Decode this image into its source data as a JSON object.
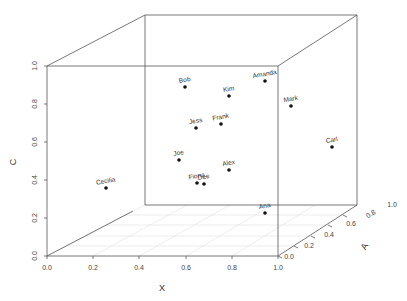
{
  "chart_data": {
    "type": "scatter3d",
    "title": "",
    "xlabel": "X",
    "ylabel": "A",
    "zlabel": "C",
    "xlim": [
      0,
      1
    ],
    "ylim": [
      0,
      1
    ],
    "zlim": [
      0,
      1
    ],
    "x_ticks": [
      "0.0",
      "0.2",
      "0.4",
      "0.6",
      "0.8",
      "1.0"
    ],
    "y_ticks": [
      "0.0",
      "0.2",
      "0.4",
      "0.6",
      "0.8",
      "1.0"
    ],
    "z_ticks": [
      "0.0",
      "0.2",
      "0.4",
      "0.6",
      "0.8",
      "1.0"
    ],
    "grid": "floor",
    "box": true,
    "points": [
      {
        "label": "Bob",
        "x": 0.45,
        "y": 0.75,
        "z": 0.9
      },
      {
        "label": "Kim",
        "x": 0.65,
        "y": 0.75,
        "z": 0.85
      },
      {
        "label": "Amanda",
        "x": 0.85,
        "y": 0.65,
        "z": 0.95
      },
      {
        "label": "Jess",
        "x": 0.5,
        "y": 0.7,
        "z": 0.7
      },
      {
        "label": "Frank",
        "x": 0.62,
        "y": 0.7,
        "z": 0.72
      },
      {
        "label": "Mark",
        "x": 0.95,
        "y": 0.5,
        "z": 0.8
      },
      {
        "label": "Joe",
        "x": 0.45,
        "y": 0.65,
        "z": 0.55
      },
      {
        "label": "Alex",
        "x": 0.7,
        "y": 0.6,
        "z": 0.48
      },
      {
        "label": "Fiona",
        "x": 0.52,
        "y": 0.7,
        "z": 0.42
      },
      {
        "label": "Dee",
        "x": 0.56,
        "y": 0.7,
        "z": 0.41
      },
      {
        "label": "Carl",
        "x": 0.98,
        "y": 0.9,
        "z": 0.58
      },
      {
        "label": "Cecilia",
        "x": 0.25,
        "y": 0.05,
        "z": 0.36
      },
      {
        "label": "Ana",
        "x": 0.85,
        "y": 0.55,
        "z": 0.05
      }
    ]
  },
  "points_px": [
    {
      "label": "Bob",
      "cx": 185,
      "cy": 87
    },
    {
      "label": "Kim",
      "cx": 229,
      "cy": 96
    },
    {
      "label": "Amanda",
      "cx": 265,
      "cy": 81
    },
    {
      "label": "Jess",
      "cx": 196,
      "cy": 128
    },
    {
      "label": "Frank",
      "cx": 221,
      "cy": 124
    },
    {
      "label": "Mark",
      "cx": 291,
      "cy": 106
    },
    {
      "label": "Joe",
      "cx": 179,
      "cy": 160
    },
    {
      "label": "Alex",
      "cx": 229,
      "cy": 170
    },
    {
      "label": "Fiona",
      "cx": 197,
      "cy": 183
    },
    {
      "label": "Dee",
      "cx": 204,
      "cy": 184
    },
    {
      "label": "Carl",
      "cx": 332,
      "cy": 147
    },
    {
      "label": "Cecilia",
      "cx": 106,
      "cy": 188
    },
    {
      "label": "Ana",
      "cx": 265,
      "cy": 213
    }
  ]
}
